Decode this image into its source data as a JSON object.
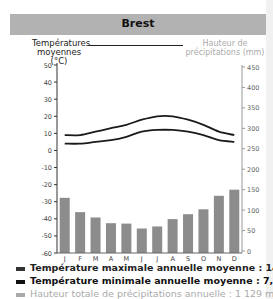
{
  "title": "Brest",
  "left_axis_label": "Températures moyennes (°C)",
  "right_axis_label": "Hauteur de précipitations (mm)",
  "legend": [
    {
      "label": "Température maximale annuelle moyenne : 14,1°C",
      "color": "#333333"
    },
    {
      "label": "Température minimale annuelle moyenne : 7,6 °C",
      "color": "#111111"
    },
    {
      "label": "Hauteur totale de précipitations annuelle : 1 129 mm",
      "color": "#aaaaaa"
    }
  ],
  "chart_data": {
    "type": "bar+line",
    "title": "Brest",
    "categories": [
      "J",
      "F",
      "M",
      "A",
      "M",
      "J",
      "J",
      "A",
      "S",
      "O",
      "N",
      "D"
    ],
    "series": [
      {
        "name": "Température maximale moyenne (°C)",
        "type": "line",
        "axis": "left",
        "values": [
          9,
          9,
          11,
          13,
          15,
          18,
          20,
          20,
          18,
          15,
          11,
          9
        ]
      },
      {
        "name": "Température minimale moyenne (°C)",
        "type": "line",
        "axis": "left",
        "values": [
          4,
          4,
          5,
          6,
          8,
          11,
          12,
          12,
          11,
          9,
          6,
          5
        ]
      },
      {
        "name": "Hauteur de précipitations (mm)",
        "type": "bar",
        "axis": "right",
        "values": [
          130,
          95,
          82,
          68,
          67,
          55,
          60,
          78,
          90,
          102,
          135,
          150
        ]
      }
    ],
    "ylabel_left": "Températures moyennes (°C)",
    "ylabel_right": "Hauteur de précipitations (mm)",
    "ylim_left": [
      -60,
      50
    ],
    "ylim_right": [
      0,
      450
    ],
    "yticks_left": [
      50,
      40,
      30,
      20,
      10,
      0,
      -10,
      -20,
      -30,
      -40,
      -50,
      -60
    ],
    "yticks_right": [
      450,
      400,
      350,
      300,
      250,
      200,
      150,
      100,
      50,
      0
    ],
    "grid": false,
    "legend_position": "bottom",
    "annual": {
      "tmax": "14,1°C",
      "tmin": "7,6 °C",
      "precip": "1 129 mm"
    }
  }
}
